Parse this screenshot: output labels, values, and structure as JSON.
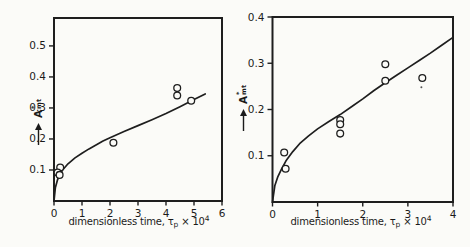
{
  "figure": {
    "background": "#fbfbf8",
    "ink_color": "#1e1e1e"
  },
  "chart_data": [
    {
      "type": "scatter",
      "title": "",
      "xlabel": {
        "prefix": "dimensionless time, ",
        "tau": "τ",
        "tau_sub": "p",
        "times": " × 10",
        "exp": "4"
      },
      "ylabel": {
        "letter": "A",
        "sup": "*",
        "sub": "mt"
      },
      "xlim": [
        0,
        6
      ],
      "ylim": [
        0,
        0.59
      ],
      "xticks": [
        "0",
        "1",
        "2",
        "3",
        "4",
        "5",
        "6"
      ],
      "yticks": [
        "0.1",
        "0.2",
        "0.3",
        "0.4",
        "0.5"
      ],
      "grid": false,
      "legend": null,
      "points": [
        [
          0.22,
          0.108
        ],
        [
          0.13,
          0.092
        ],
        [
          0.2,
          0.084
        ],
        [
          2.12,
          0.188
        ],
        [
          4.4,
          0.364
        ],
        [
          4.4,
          0.34
        ],
        [
          4.9,
          0.323
        ]
      ],
      "curve": [
        [
          0,
          0
        ],
        [
          0.05,
          0.044
        ],
        [
          0.12,
          0.067
        ],
        [
          0.2,
          0.084
        ],
        [
          0.3,
          0.099
        ],
        [
          0.5,
          0.12
        ],
        [
          0.75,
          0.139
        ],
        [
          1.0,
          0.154
        ],
        [
          1.25,
          0.168
        ],
        [
          1.5,
          0.181
        ],
        [
          1.75,
          0.193
        ],
        [
          2.0,
          0.204
        ],
        [
          2.5,
          0.224
        ],
        [
          3.0,
          0.243
        ],
        [
          3.5,
          0.262
        ],
        [
          4.0,
          0.282
        ],
        [
          4.5,
          0.304
        ],
        [
          5.0,
          0.327
        ],
        [
          5.4,
          0.345
        ]
      ],
      "marker": "open-circle",
      "line_color": "#1e1e1e"
    },
    {
      "type": "scatter",
      "title": "",
      "xlabel": {
        "prefix": "dimensionless time, ",
        "tau": "τ",
        "tau_sub": "p",
        "times": " × 10",
        "exp": "4"
      },
      "ylabel": {
        "letter": "A",
        "sup": "*",
        "sub": "mt"
      },
      "xlim": [
        0,
        4
      ],
      "ylim": [
        0,
        0.4
      ],
      "xticks": [
        "0",
        "1",
        "2",
        "3",
        "4"
      ],
      "yticks": [
        "0.1",
        "0.2",
        "0.3",
        "0.4"
      ],
      "grid": false,
      "legend": null,
      "points": [
        [
          0.26,
          0.107
        ],
        [
          0.29,
          0.072
        ],
        [
          1.5,
          0.177
        ],
        [
          1.5,
          0.168
        ],
        [
          1.5,
          0.148
        ],
        [
          2.5,
          0.298
        ],
        [
          2.5,
          0.262
        ],
        [
          3.32,
          0.268
        ]
      ],
      "speck": [
        3.3,
        0.248
      ],
      "curve": [
        [
          0,
          0
        ],
        [
          0.05,
          0.035
        ],
        [
          0.12,
          0.055
        ],
        [
          0.2,
          0.071
        ],
        [
          0.3,
          0.089
        ],
        [
          0.45,
          0.109
        ],
        [
          0.6,
          0.126
        ],
        [
          0.8,
          0.143
        ],
        [
          1.0,
          0.158
        ],
        [
          1.25,
          0.174
        ],
        [
          1.5,
          0.189
        ],
        [
          1.75,
          0.206
        ],
        [
          2.0,
          0.223
        ],
        [
          2.25,
          0.241
        ],
        [
          2.5,
          0.258
        ],
        [
          2.75,
          0.274
        ],
        [
          3.0,
          0.29
        ],
        [
          3.25,
          0.306
        ],
        [
          3.5,
          0.322
        ],
        [
          3.75,
          0.339
        ],
        [
          4.0,
          0.356
        ]
      ],
      "marker": "open-circle",
      "line_color": "#1e1e1e"
    }
  ]
}
